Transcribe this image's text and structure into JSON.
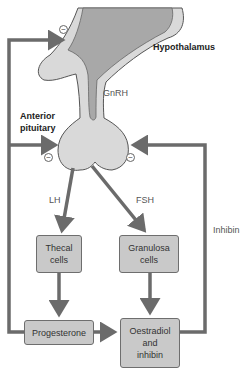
{
  "diagram": {
    "labels": {
      "hypothalamus": "Hypothalamus",
      "anterior_pituitary": "Anterior pituitary",
      "gnrh": "GnRH",
      "lh": "LH",
      "fsh": "FSH",
      "inhibin": "Inhibin"
    },
    "boxes": {
      "thecal": "Thecal cells",
      "granulosa": "Granulosa cells",
      "progesterone": "Progesterone",
      "oestradiol": "Oestradiol and inhibin"
    },
    "feedback_symbol": "−",
    "colors": {
      "arrow": "#6b6b6b",
      "box_fill": "#c9c9c9",
      "gland_fill": "#d9d9d9",
      "hypothalamus_core": "#a8a8a8"
    }
  }
}
